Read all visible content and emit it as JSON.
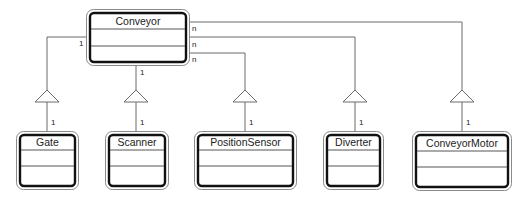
{
  "diagram": {
    "type": "UML class diagram",
    "parent": {
      "name": "Conveyor",
      "multiplicity_left": "1",
      "multiplicity_bottom": "1",
      "multiplicities_right": [
        "n",
        "n",
        "n"
      ]
    },
    "children": [
      {
        "name": "Gate",
        "multiplicity": "1"
      },
      {
        "name": "Scanner",
        "multiplicity": "1"
      },
      {
        "name": "PositionSensor",
        "multiplicity": "1"
      },
      {
        "name": "Diverter",
        "multiplicity": "1"
      },
      {
        "name": "ConveyorMotor",
        "multiplicity": "1"
      }
    ]
  }
}
